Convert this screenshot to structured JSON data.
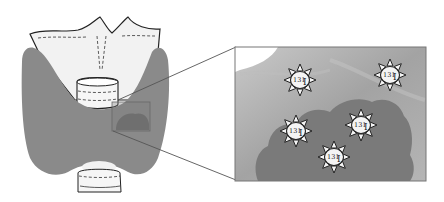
{
  "diagram": {
    "thyroid": {
      "fill": "#8a8a8a",
      "cartilage_fill": "#f2f2f2"
    },
    "inset": {
      "background": "#a8a8a8",
      "tissue_fill": "#7a7a7a",
      "border": "#777777",
      "isotopes": [
        {
          "mass": "131",
          "symbol": "I",
          "cx": 300,
          "cy": 80
        },
        {
          "mass": "131",
          "symbol": "I",
          "cx": 390,
          "cy": 75
        },
        {
          "mass": "131",
          "symbol": "I",
          "cx": 296,
          "cy": 131
        },
        {
          "mass": "131",
          "symbol": "I",
          "cx": 361,
          "cy": 125
        },
        {
          "mass": "131",
          "symbol": "I",
          "cx": 334,
          "cy": 157
        }
      ]
    }
  }
}
